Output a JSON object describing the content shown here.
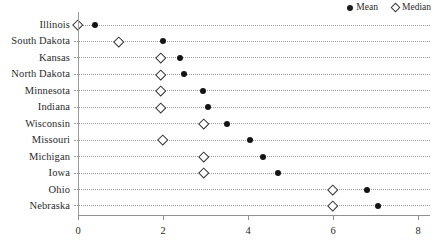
{
  "chart_data": {
    "type": "scatter",
    "title": "",
    "subtitle": "",
    "xlabel": "",
    "ylabel": "",
    "orientation": "horizontal",
    "xlim": [
      0,
      8
    ],
    "xticks": [
      0,
      2,
      4,
      6,
      8
    ],
    "xtick_labels": [
      "0",
      "2",
      "4",
      "6",
      "8"
    ],
    "grid": "horizontal-dotted",
    "legend_position": "top-right",
    "legend": [
      {
        "name": "Mean",
        "marker": "filled-circle",
        "color": "#141414"
      },
      {
        "name": "Median",
        "marker": "open-diamond",
        "color": "#333333"
      }
    ],
    "categories": [
      "Illinois",
      "South Dakota",
      "Kansas",
      "North Dakota",
      "Minnesota",
      "Indiana",
      "Wisconsin",
      "Missouri",
      "Michigan",
      "Iowa",
      "Ohio",
      "Nebraska"
    ],
    "series": [
      {
        "name": "Mean",
        "values": [
          0.4,
          2.0,
          2.4,
          2.5,
          2.95,
          3.05,
          3.5,
          4.05,
          4.35,
          4.7,
          6.8,
          7.05
        ]
      },
      {
        "name": "Median",
        "values": [
          0.0,
          0.95,
          1.95,
          1.95,
          1.95,
          1.95,
          2.95,
          2.0,
          2.95,
          2.95,
          6.0,
          6.0
        ]
      }
    ]
  },
  "axis": {
    "x_tick_labels": [
      "0",
      "2",
      "4",
      "6",
      "8"
    ]
  }
}
